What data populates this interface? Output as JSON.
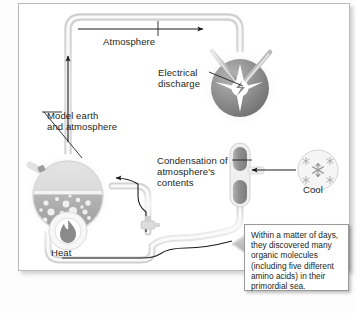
{
  "figure": {
    "background_color": "#ffffff",
    "panel_border_color": "#b9b9b9",
    "ink_color": "#231f20",
    "tube_fill": "#e8e8e8",
    "tube_edge": "#c9c9c9",
    "flow_arrow_color": "#1a1a1a"
  },
  "labels": {
    "atmosphere": "Atmosphere",
    "electrical_discharge": "Electrical\ndischarge",
    "model_earth": "Model earth\nand atmosphere",
    "condensation": "Condensation of\natmosphere's\ncontents",
    "cool": "Cool",
    "heat": "Heat"
  },
  "callout": {
    "text": "Within a matter of days, they discovered many organic molecules (including five different amino acids) in their primordial sea.",
    "border_color": "#9a9a9a",
    "background": "#ffffff"
  },
  "apparatus": {
    "discharge_chamber": {
      "name": "electrical discharge flask",
      "fill": "#8c8c8c",
      "spark_color": "#ffffff",
      "electrode_count": 2
    },
    "model_earth_flask": {
      "name": "model earth and atmosphere flask",
      "atmosphere_fill": "#d8d8d8",
      "sea_fill": "#a8a8a8",
      "bubble_color": "#f2f2f2",
      "bubble_count": 22
    },
    "condenser": {
      "name": "condenser column",
      "fill": "#9d9d9d"
    },
    "cool_source": {
      "name": "cooling source",
      "glyph": "snowflake",
      "fill": "#f3f3f3",
      "glyph_count": 5
    },
    "heat_source": {
      "name": "heat source burner",
      "glyph": "flame",
      "fill": "#f7f7f7"
    },
    "stopcock": {
      "name": "sampling stopcock valve",
      "fill": "#d4d4d4"
    },
    "block_arrow": {
      "name": "sample collection arrow",
      "direction": "left",
      "fill": "#bdbdbd"
    }
  },
  "icons": {
    "snowflake": "snowflake-icon",
    "flame": "flame-icon",
    "spark": "spark-icon",
    "block_arrow": "block-arrow-left-icon"
  }
}
